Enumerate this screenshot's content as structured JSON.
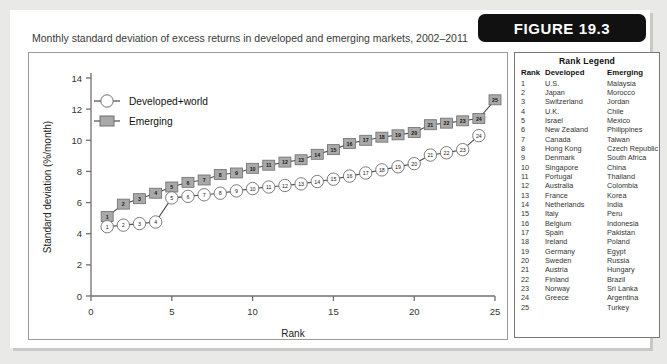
{
  "figure": {
    "banner_label": "FIGURE 19.3",
    "title": "Monthly standard deviation of excess returns in developed and emerging markets, 2002–2011"
  },
  "rank_legend": {
    "title": "Rank Legend",
    "headers": [
      "Rank",
      "Developed",
      "Emerging"
    ],
    "rows": [
      [
        "1",
        "U.S.",
        "Malaysia"
      ],
      [
        "2",
        "Japan",
        "Morocco"
      ],
      [
        "3",
        "Switzerland",
        "Jordan"
      ],
      [
        "4",
        "U.K.",
        "Chile"
      ],
      [
        "5",
        "Israel",
        "Mexico"
      ],
      [
        "6",
        "New Zealand",
        "Philippines"
      ],
      [
        "7",
        "Canada",
        "Taiwan"
      ],
      [
        "8",
        "Hong Kong",
        "Czech Republic"
      ],
      [
        "9",
        "Denmark",
        "South Africa"
      ],
      [
        "10",
        "Singapore",
        "China"
      ],
      [
        "11",
        "Portugal",
        "Thailand"
      ],
      [
        "12",
        "Australia",
        "Colombia"
      ],
      [
        "13",
        "France",
        "Korea"
      ],
      [
        "14",
        "Netherlands",
        "India"
      ],
      [
        "15",
        "Italy",
        "Peru"
      ],
      [
        "16",
        "Belgium",
        "Indonesia"
      ],
      [
        "17",
        "Spain",
        "Pakistan"
      ],
      [
        "18",
        "Ireland",
        "Poland"
      ],
      [
        "19",
        "Germany",
        "Egypt"
      ],
      [
        "20",
        "Sweden",
        "Russia"
      ],
      [
        "21",
        "Austria",
        "Hungary"
      ],
      [
        "22",
        "Finland",
        "Brazil"
      ],
      [
        "23",
        "Norway",
        "Sri Lanka"
      ],
      [
        "24",
        "Greece",
        "Argentina"
      ],
      [
        "25",
        "",
        "Turkey"
      ]
    ]
  },
  "chart_data": {
    "type": "line",
    "title": "Monthly standard deviation of excess returns in developed and emerging markets, 2002–2011",
    "xlabel": "Rank",
    "xlabel_sub": "Markets are ranked by SD of return, from low to high",
    "ylabel": "Standard deviation (%/month)",
    "xlim": [
      0,
      25
    ],
    "ylim": [
      0,
      14
    ],
    "xticks": [
      0,
      5,
      10,
      15,
      20,
      25
    ],
    "yticks": [
      0,
      2,
      4,
      6,
      8,
      10,
      12,
      14
    ],
    "grid": false,
    "legend_position": "upper-left",
    "series": [
      {
        "name": "Developed+world",
        "marker": "circle-open",
        "color": "#ffffff",
        "x": [
          1,
          2,
          3,
          4,
          5,
          6,
          7,
          8,
          9,
          10,
          11,
          12,
          13,
          14,
          15,
          16,
          17,
          18,
          19,
          20,
          21,
          22,
          23,
          24
        ],
        "values": [
          4.45,
          4.55,
          4.65,
          4.75,
          6.3,
          6.4,
          6.5,
          6.6,
          6.75,
          6.9,
          7.0,
          7.1,
          7.2,
          7.35,
          7.5,
          7.7,
          7.9,
          8.1,
          8.3,
          8.5,
          9.05,
          9.2,
          9.4,
          10.3
        ]
      },
      {
        "name": "Emerging",
        "marker": "square-filled",
        "color": "#a9a9a9",
        "x": [
          1,
          2,
          3,
          4,
          5,
          6,
          7,
          8,
          9,
          10,
          11,
          12,
          13,
          14,
          15,
          16,
          17,
          18,
          19,
          20,
          21,
          22,
          23,
          24,
          25
        ],
        "values": [
          5.1,
          5.9,
          6.25,
          6.6,
          7.0,
          7.3,
          7.45,
          7.8,
          7.9,
          8.2,
          8.4,
          8.6,
          8.75,
          9.1,
          9.4,
          9.8,
          10.0,
          10.2,
          10.35,
          10.5,
          11.0,
          11.1,
          11.25,
          11.4,
          12.6
        ]
      }
    ]
  }
}
